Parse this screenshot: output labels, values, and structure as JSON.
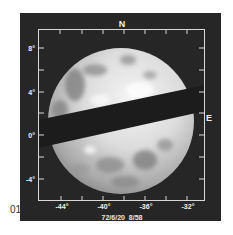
{
  "figure": {
    "number": "01",
    "caption": "72/6/20  8/58",
    "compass": {
      "north": "N",
      "east": "E"
    },
    "latitude_labels": [
      "8°",
      "4°",
      "0°",
      "-4°"
    ],
    "longitude_labels": [
      "-44°",
      "-40°",
      "-36°",
      "-32°"
    ],
    "colors": {
      "panel": "#262626",
      "frame": "#d8d8d8",
      "band": "#1c1c1c",
      "planet_light": "#f2f2f2",
      "planet_mid": "#b8b8b8",
      "planet_dark": "#6a6a6a"
    }
  }
}
